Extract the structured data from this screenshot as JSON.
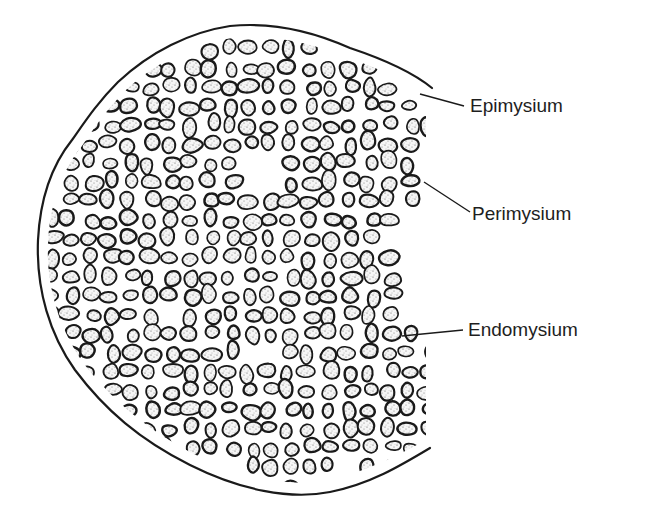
{
  "figure": {
    "colors": {
      "background": "#ffffff",
      "outline": "#1a1a1a",
      "fiber_fill": "#f4f4f4",
      "stipple": "#555555",
      "label_text": "#1e1e1e"
    },
    "outer_boundary": {
      "name": "epimysium",
      "cut_edge_x": 432,
      "top_end": [
        432,
        88
      ],
      "bottom_end": [
        430,
        448
      ]
    },
    "labels": [
      {
        "id": "epimysium",
        "text": "Epimysium",
        "text_pos": [
          470,
          96
        ],
        "leader": [
          [
            420,
            94
          ],
          [
            464,
            106
          ]
        ]
      },
      {
        "id": "perimysium",
        "text": "Perimysium",
        "text_pos": [
          472,
          204
        ],
        "leader": [
          [
            424,
            182
          ],
          [
            470,
            212
          ]
        ]
      },
      {
        "id": "endomysium",
        "text": "Endomysium",
        "text_pos": [
          468,
          320
        ],
        "leader": [
          [
            402,
            336
          ],
          [
            463,
            330
          ]
        ]
      }
    ],
    "fascicles": [
      {
        "name": "fascicle-upper-left",
        "center": [
          150,
          135
        ],
        "rx": 78,
        "ry": 70
      },
      {
        "name": "fascicle-upper-middle",
        "center": [
          262,
          88
        ],
        "rx": 66,
        "ry": 50
      },
      {
        "name": "fascicle-upper-right",
        "center": [
          350,
          150
        ],
        "rx": 72,
        "ry": 80
      },
      {
        "name": "fascicle-left",
        "center": [
          105,
          275
        ],
        "rx": 60,
        "ry": 110
      },
      {
        "name": "fascicle-center",
        "center": [
          235,
          262
        ],
        "rx": 70,
        "ry": 75
      },
      {
        "name": "fascicle-center-right",
        "center": [
          335,
          300
        ],
        "rx": 62,
        "ry": 70
      },
      {
        "name": "fascicle-lower-left",
        "center": [
          170,
          395
        ],
        "rx": 80,
        "ry": 60
      },
      {
        "name": "fascicle-lower-middle",
        "center": [
          285,
          420
        ],
        "rx": 60,
        "ry": 60
      },
      {
        "name": "fascicle-lower-right",
        "center": [
          385,
          395
        ],
        "rx": 48,
        "ry": 72
      }
    ]
  }
}
